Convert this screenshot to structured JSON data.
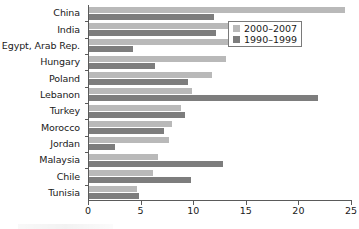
{
  "chart_data": {
    "type": "bar",
    "orientation": "horizontal",
    "title": "",
    "xlabel": "",
    "ylabel": "",
    "xlim": [
      0,
      25
    ],
    "xticks": [
      0,
      5,
      10,
      15,
      20,
      25
    ],
    "grid": false,
    "legend_position": "top-right",
    "categories": [
      "China",
      "India",
      "Egypt, Arab Rep.",
      "Hungary",
      "Poland",
      "Lebanon",
      "Turkey",
      "Morocco",
      "Jordan",
      "Malaysia",
      "Chile",
      "Tunisia"
    ],
    "series": [
      {
        "name": "2000–2007",
        "color": "#b9b9b9",
        "values": [
          24.3,
          15.6,
          14.7,
          13.0,
          11.7,
          9.8,
          8.7,
          7.9,
          7.6,
          6.6,
          6.1,
          4.6
        ]
      },
      {
        "name": "1990–1999",
        "color": "#7d7d7d",
        "values": [
          11.9,
          12.1,
          4.2,
          6.3,
          9.4,
          21.8,
          9.1,
          7.1,
          2.5,
          12.7,
          9.7,
          4.8
        ]
      }
    ]
  },
  "legend": {
    "items": [
      {
        "label": "2000–2007",
        "swatch": "light"
      },
      {
        "label": "1990–1999",
        "swatch": "dark"
      }
    ]
  },
  "axis": {
    "x_tick_labels": [
      "0",
      "5",
      "10",
      "15",
      "20",
      "25"
    ]
  }
}
